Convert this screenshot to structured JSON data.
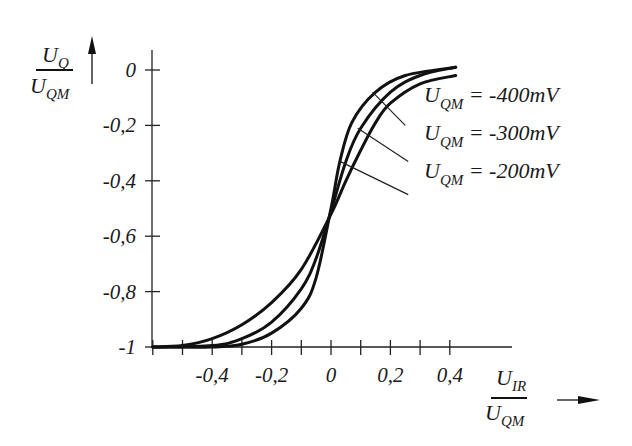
{
  "chart_data": {
    "type": "line",
    "title": "",
    "xlabel": {
      "main": "U",
      "sub": "IR",
      "denom_main": "U",
      "denom_sub": "QM"
    },
    "ylabel": {
      "main": "U",
      "sub": "Q",
      "denom_main": "U",
      "denom_sub": "QM"
    },
    "xlim": [
      -0.6,
      0.6
    ],
    "ylim": [
      -1,
      0.05
    ],
    "x_ticks": [
      -0.6,
      -0.5,
      -0.4,
      -0.3,
      -0.2,
      -0.1,
      0,
      0.1,
      0.2,
      0.3,
      0.4
    ],
    "x_tick_labels": [
      {
        "value": -0.4,
        "label": "-0,4"
      },
      {
        "value": -0.2,
        "label": "-0,2"
      },
      {
        "value": 0,
        "label": "0"
      },
      {
        "value": 0.2,
        "label": "0,2"
      },
      {
        "value": 0.4,
        "label": "0,4"
      }
    ],
    "y_tick_labels": [
      {
        "value": 0,
        "label": "0"
      },
      {
        "value": -0.2,
        "label": "-0,2"
      },
      {
        "value": -0.4,
        "label": "-0,4"
      },
      {
        "value": -0.6,
        "label": "-0,6"
      },
      {
        "value": -0.8,
        "label": "-0,8"
      },
      {
        "value": -1,
        "label": "-1"
      }
    ],
    "grid": false,
    "legend_position": "inline-right",
    "series": [
      {
        "name": "U_QM = -400mV",
        "label_main": "U",
        "label_sub": "QM",
        "label_value": " = -400mV",
        "x": [
          -0.6,
          -0.4,
          -0.3,
          -0.2,
          -0.1,
          -0.05,
          0,
          0.03,
          0.07,
          0.15,
          0.25,
          0.42
        ],
        "y": [
          -1,
          -1,
          -0.99,
          -0.95,
          -0.86,
          -0.75,
          -0.5,
          -0.33,
          -0.19,
          -0.08,
          -0.02,
          0.01
        ],
        "leader": {
          "from": [
            0.14,
            -0.08
          ],
          "to": [
            0.25,
            -0.2
          ]
        }
      },
      {
        "name": "U_QM = -300mV",
        "label_main": "U",
        "label_sub": "QM",
        "label_value": " = -300mV",
        "x": [
          -0.6,
          -0.4,
          -0.3,
          -0.2,
          -0.1,
          -0.05,
          0,
          0.05,
          0.1,
          0.2,
          0.3,
          0.42
        ],
        "y": [
          -1,
          -0.995,
          -0.97,
          -0.91,
          -0.79,
          -0.68,
          -0.51,
          -0.33,
          -0.21,
          -0.08,
          -0.02,
          0.01
        ],
        "leader": {
          "from": [
            0.09,
            -0.21
          ],
          "to": [
            0.26,
            -0.33
          ]
        }
      },
      {
        "name": "U_QM = -200mV",
        "label_main": "U",
        "label_sub": "QM",
        "label_value": " = -200mV",
        "x": [
          -0.6,
          -0.5,
          -0.4,
          -0.3,
          -0.2,
          -0.1,
          0,
          0.05,
          0.1,
          0.15,
          0.2,
          0.3,
          0.42
        ],
        "y": [
          -1,
          -0.995,
          -0.97,
          -0.92,
          -0.84,
          -0.72,
          -0.52,
          -0.4,
          -0.29,
          -0.19,
          -0.12,
          -0.05,
          -0.02
        ],
        "leader": {
          "from": [
            0.03,
            -0.33
          ],
          "to": [
            0.26,
            -0.45
          ]
        }
      }
    ]
  }
}
